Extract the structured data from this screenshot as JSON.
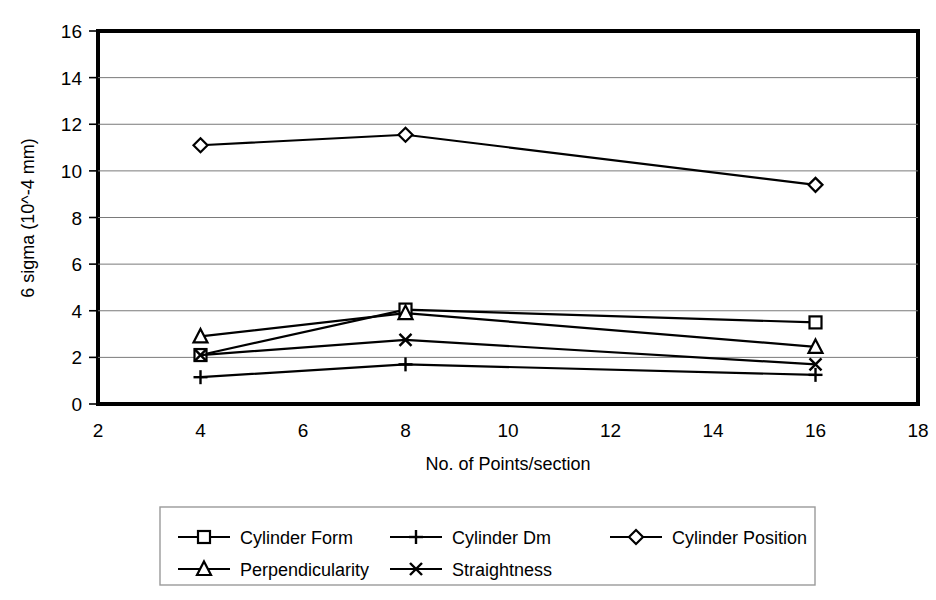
{
  "chart_data": {
    "type": "line",
    "title": "",
    "xlabel": "No. of Points/section",
    "ylabel": "6 sigma (10^-4 mm)",
    "x": [
      4,
      8,
      16
    ],
    "xlim": [
      2,
      18
    ],
    "ylim": [
      0,
      16
    ],
    "xticks": [
      "2",
      "4",
      "6",
      "8",
      "10",
      "12",
      "14",
      "16",
      "18"
    ],
    "yticks": [
      "0",
      "2",
      "4",
      "6",
      "8",
      "10",
      "12",
      "14",
      "16"
    ],
    "grid": "horizontal",
    "legend_position": "bottom",
    "series": [
      {
        "name": "Cylinder Form",
        "marker": "square",
        "values": [
          2.1,
          4.05,
          3.5
        ]
      },
      {
        "name": "Cylinder Dm",
        "marker": "plus",
        "values": [
          1.15,
          1.7,
          1.25
        ]
      },
      {
        "name": "Cylinder Position",
        "marker": "diamond",
        "values": [
          11.1,
          11.55,
          9.4
        ]
      },
      {
        "name": "Perpendicularity",
        "marker": "triangle",
        "values": [
          2.9,
          3.9,
          2.45
        ]
      },
      {
        "name": "Straightness",
        "marker": "cross",
        "values": [
          2.1,
          2.75,
          1.7
        ]
      }
    ]
  },
  "axes": {
    "y_title": "6 sigma (10^-4 mm)",
    "x_title": "No. of Points/section",
    "y_tick_labels": [
      "16",
      "14",
      "12",
      "10",
      "8",
      "6",
      "4",
      "2",
      "0"
    ],
    "x_tick_labels": [
      "2",
      "4",
      "6",
      "8",
      "10",
      "12",
      "14",
      "16",
      "18"
    ]
  },
  "legend": {
    "entries": [
      {
        "label": "Cylinder Form",
        "marker": "square"
      },
      {
        "label": "Cylinder Dm",
        "marker": "plus"
      },
      {
        "label": "Cylinder Position",
        "marker": "diamond"
      },
      {
        "label": "Perpendicularity",
        "marker": "triangle"
      },
      {
        "label": "Straightness",
        "marker": "cross"
      }
    ]
  },
  "colors": {
    "series": "#000000",
    "grid": "#7a7a7a",
    "frame": "#000000",
    "background": "#ffffff"
  }
}
